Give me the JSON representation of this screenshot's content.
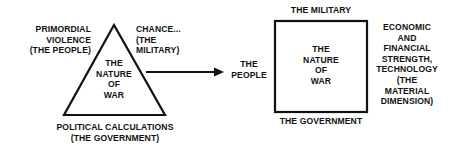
{
  "left_diagram": {
    "shape": "triangle",
    "center_label": "THE\nNATURE\nOF\nWAR",
    "top_left_label": "PRIMORDIAL\nVIOLENCE\n(THE PEOPLE)",
    "top_right_label": "CHANCE...\n(THE\nMILITARY)",
    "bottom_label": "POLITICAL CALCULATIONS\n(THE GOVERNMENT)"
  },
  "arrow": {
    "icon": "right-arrow-icon"
  },
  "right_diagram": {
    "shape": "square",
    "center_label": "THE\nNATURE\nOF\nWAR",
    "top_label": "THE MILITARY",
    "left_label": "THE\nPEOPLE",
    "bottom_label": "THE GOVERNMENT",
    "right_label": "ECONOMIC\nAND\nFINANCIAL\nSTRENGTH,\nTECHNOLOGY\n(THE\nMATERIAL\nDIMENSION)"
  },
  "colors": {
    "ink": "#111111",
    "background": "#ffffff"
  }
}
